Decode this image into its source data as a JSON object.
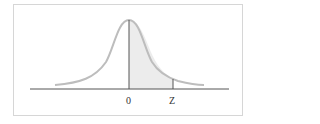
{
  "diagram": {
    "type": "normal-distribution-curve",
    "shaded_region": "area between 0 and Z",
    "labels": {
      "mean": "0",
      "z": "Z"
    },
    "colors": {
      "curve": "#bdbdbd",
      "shade": "#ececec",
      "axis": "#555555",
      "frame": "#d6d6d6"
    }
  }
}
